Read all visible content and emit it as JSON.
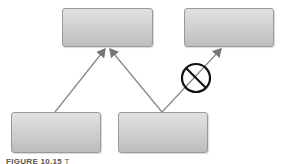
{
  "diagram": {
    "nodes": [
      {
        "id": "top-left",
        "label": ""
      },
      {
        "id": "top-right",
        "label": ""
      },
      {
        "id": "bottom-left",
        "label": ""
      },
      {
        "id": "bottom-right",
        "label": ""
      }
    ],
    "edges": [
      {
        "from": "bottom-left",
        "to": "top-left",
        "allowed": true
      },
      {
        "from": "bottom-right",
        "to": "top-left",
        "allowed": true
      },
      {
        "from": "bottom-right",
        "to": "top-right",
        "allowed": false,
        "marker": "prohibited-icon"
      }
    ],
    "colors": {
      "line": "#8a8a8a",
      "prohibit": "#111111",
      "box_top": "#e2e2e2",
      "box_bottom": "#bdbdbd"
    }
  },
  "caption": {
    "figure_label": "FIGURE 10.15",
    "text": "T"
  }
}
